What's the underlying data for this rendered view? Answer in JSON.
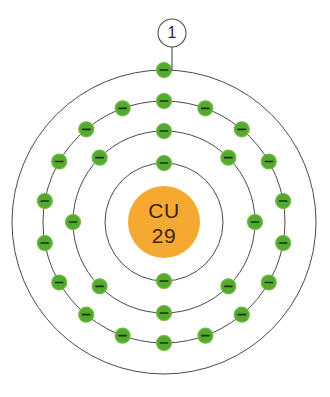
{
  "figure": {
    "background_color": "#ffffff",
    "width": 330,
    "height": 397
  },
  "nucleus": {
    "symbol": "CU",
    "atomic_number": "29",
    "fill_color": "#F5A931",
    "text_color": "#3a2410",
    "center_x": 164,
    "center_y": 222,
    "radius": 36
  },
  "callout": {
    "label": "1",
    "circle_center_x": 172,
    "circle_center_y": 33,
    "circle_radius": 14,
    "leader_from_y": 47,
    "leader_to_y": 70,
    "stroke_color": "#4a4a4a"
  },
  "electron": {
    "fill_color": "#55A830",
    "edge_color": "#6fbb45",
    "sign_color": "#17350c",
    "sign_glyph": "-",
    "radius": 7.5
  },
  "shells": [
    {
      "name": "shell-1",
      "index": 1,
      "radius": 59,
      "electron_count": 2,
      "start_angle_deg": -90,
      "stroke_color": "#4a4a4a"
    },
    {
      "name": "shell-2",
      "index": 2,
      "radius": 91,
      "electron_count": 8,
      "start_angle_deg": -90,
      "stroke_color": "#4a4a4a"
    },
    {
      "name": "shell-3",
      "index": 3,
      "radius": 121,
      "electron_count": 18,
      "start_angle_deg": -90,
      "stroke_color": "#4a4a4a"
    },
    {
      "name": "shell-4",
      "index": 4,
      "radius": 152,
      "electron_count": 1,
      "start_angle_deg": -90,
      "stroke_color": "#4a4a4a"
    }
  ],
  "chart_data": {
    "type": "diagram",
    "element_symbol": "CU",
    "atomic_number": 29,
    "electron_configuration_shells": [
      2,
      8,
      18,
      1
    ],
    "shell_labels": [
      "K",
      "L",
      "M",
      "N"
    ],
    "annotations": [
      {
        "label": "1",
        "points_to": "outermost-shell-electron",
        "shell_index": 4
      }
    ],
    "total_electrons": 29,
    "colors": {
      "nucleus": "#F5A931",
      "electron": "#55A830",
      "shell_line": "#4a4a4a",
      "background": "#ffffff"
    }
  }
}
